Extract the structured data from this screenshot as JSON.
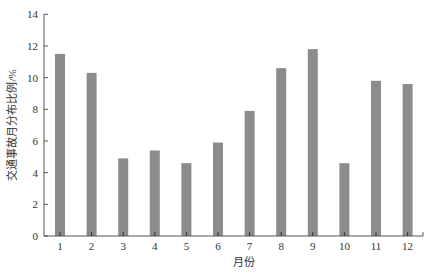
{
  "chart_data": {
    "type": "bar",
    "title": "",
    "xlabel": "月份",
    "ylabel": "交通事故月分布比例/%",
    "categories": [
      "1",
      "2",
      "3",
      "4",
      "5",
      "6",
      "7",
      "8",
      "9",
      "10",
      "11",
      "12"
    ],
    "values": [
      11.5,
      10.3,
      4.9,
      5.4,
      4.6,
      5.9,
      7.9,
      10.6,
      11.8,
      4.6,
      9.8,
      9.6
    ],
    "ylim": [
      0,
      14
    ],
    "yticks": [
      0,
      2,
      4,
      6,
      8,
      10,
      12,
      14
    ],
    "grid": false,
    "legend": null,
    "bar_color": "#8c8c8c",
    "axis_color": "#555555"
  }
}
